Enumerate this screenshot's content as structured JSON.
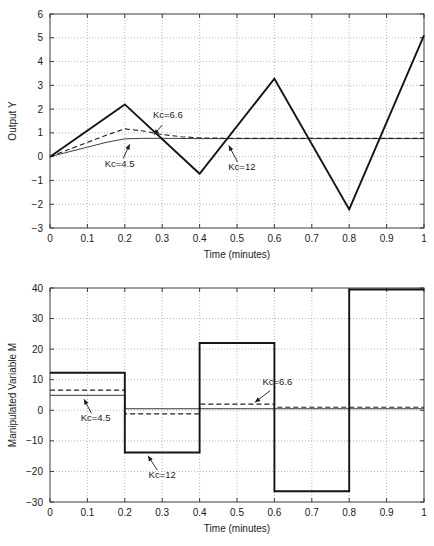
{
  "figure": {
    "background": "#ffffff",
    "axis_color": "#3a3a3a",
    "grid_color": "#9a9a9a"
  },
  "chart_data": [
    {
      "id": "output-y",
      "type": "line",
      "title": "",
      "xlabel": "Time (minutes)",
      "ylabel": "Output Y",
      "xlim": [
        0,
        1
      ],
      "ylim": [
        -3,
        6
      ],
      "xticks": [
        0,
        0.1,
        0.2,
        0.3,
        0.4,
        0.5,
        0.6,
        0.7,
        0.8,
        0.9,
        1
      ],
      "xticklabels": [
        "0",
        "0.1",
        "0.2",
        "0.3",
        "0.4",
        "0.5",
        "0.6",
        "0.7",
        "0.8",
        "0.9",
        "1"
      ],
      "yticks": [
        -3,
        -2,
        -1,
        0,
        1,
        2,
        3,
        4,
        5,
        6
      ],
      "yticklabels": [
        "−3",
        "−2",
        "−1",
        "0",
        "1",
        "2",
        "3",
        "4",
        "5",
        "6"
      ],
      "grid": true,
      "legend_position": "inline-annotations",
      "series": [
        {
          "name": "Kc=12",
          "style": "solid",
          "color": "#151515",
          "width": 1.9,
          "x": [
            0,
            0.2,
            0.4,
            0.6,
            0.8,
            1.0
          ],
          "values": [
            0,
            2.2,
            -0.72,
            3.28,
            -2.22,
            5.1
          ]
        },
        {
          "name": "Kc=6.6",
          "style": "dashed",
          "color": "#202020",
          "width": 1.1,
          "x": [
            0,
            0.05,
            0.1,
            0.15,
            0.2,
            0.25,
            0.3,
            0.35,
            0.4,
            0.5,
            0.6,
            0.7,
            0.8,
            0.9,
            1.0
          ],
          "values": [
            0,
            0.3,
            0.6,
            0.9,
            1.17,
            1.08,
            0.93,
            0.84,
            0.79,
            0.77,
            0.77,
            0.77,
            0.77,
            0.77,
            0.77
          ]
        },
        {
          "name": "Kc=4.5",
          "style": "solid",
          "color": "#353535",
          "width": 0.95,
          "x": [
            0,
            0.05,
            0.1,
            0.15,
            0.2,
            0.25,
            0.3,
            0.4,
            0.5,
            0.6,
            0.8,
            1.0
          ],
          "values": [
            0,
            0.2,
            0.4,
            0.6,
            0.75,
            0.77,
            0.77,
            0.76,
            0.76,
            0.76,
            0.76,
            0.76
          ]
        }
      ],
      "annotations": [
        {
          "label": "Kc=6.6",
          "text_x": 0.315,
          "text_y": 1.62,
          "tip_x": 0.278,
          "tip_y": 0.92,
          "anchor": "middle"
        },
        {
          "label": "Kc=4.5",
          "text_x": 0.186,
          "text_y": -0.42,
          "tip_x": 0.213,
          "tip_y": 0.52,
          "anchor": "middle"
        },
        {
          "label": "Kc=12",
          "text_x": 0.513,
          "text_y": -0.56,
          "tip_x": 0.478,
          "tip_y": 0.47,
          "anchor": "middle"
        }
      ]
    },
    {
      "id": "manipulated-variable-m",
      "type": "line",
      "title": "",
      "xlabel": "Time (minutes)",
      "ylabel": "Manipulated Variable M",
      "xlim": [
        0,
        1
      ],
      "ylim": [
        -30,
        40
      ],
      "xticks": [
        0,
        0.1,
        0.2,
        0.3,
        0.4,
        0.5,
        0.6,
        0.7,
        0.8,
        0.9,
        1
      ],
      "xticklabels": [
        "0",
        "0.1",
        "0.2",
        "0.3",
        "0.4",
        "0.5",
        "0.6",
        "0.7",
        "0.8",
        "0.9",
        "1"
      ],
      "yticks": [
        -30,
        -20,
        -10,
        0,
        10,
        20,
        30,
        40
      ],
      "yticklabels": [
        "−30",
        "−20",
        "−10",
        "0",
        "10",
        "20",
        "30",
        "40"
      ],
      "grid": true,
      "legend_position": "inline-annotations",
      "series": [
        {
          "name": "Kc=12",
          "style": "step",
          "color": "#151515",
          "width": 1.9,
          "x": [
            0,
            0.2,
            0.4,
            0.6,
            0.8,
            1.0
          ],
          "values": [
            12.3,
            -13.8,
            22.0,
            -26.5,
            39.5,
            39.5
          ]
        },
        {
          "name": "Kc=6.6",
          "style": "step-dashed",
          "color": "#202020",
          "width": 1.2,
          "x": [
            0,
            0.2,
            0.4,
            0.6,
            0.8,
            1.0
          ],
          "values": [
            6.6,
            -1.2,
            2.0,
            1.0,
            1.0,
            1.0
          ]
        },
        {
          "name": "Kc=4.5",
          "style": "step",
          "color": "#353535",
          "width": 1.0,
          "x": [
            0,
            0.2,
            0.4,
            0.6,
            0.8,
            1.0
          ],
          "values": [
            4.9,
            0.5,
            0.5,
            0.5,
            0.5,
            0.5
          ]
        }
      ],
      "annotations": [
        {
          "label": "Kc=4.5",
          "text_x": 0.122,
          "text_y": -3.6,
          "tip_x": 0.091,
          "tip_y": 3.6,
          "anchor": "middle"
        },
        {
          "label": "Kc=6.6",
          "text_x": 0.608,
          "text_y": 8.2,
          "tip_x": 0.548,
          "tip_y": 2.6,
          "anchor": "middle"
        },
        {
          "label": "Kc=12",
          "text_x": 0.3,
          "text_y": -22.0,
          "tip_x": 0.262,
          "tip_y": -14.9,
          "anchor": "middle"
        }
      ]
    }
  ]
}
